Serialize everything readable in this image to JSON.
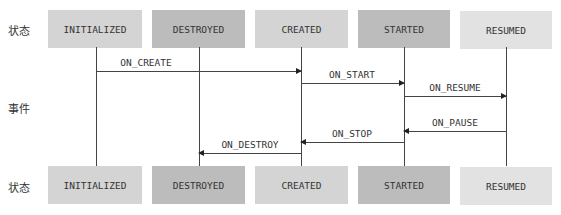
{
  "labels": {
    "top_state": "状态",
    "event": "事件",
    "bottom_state": "状态"
  },
  "states": [
    {
      "name": "INITIALIZED",
      "color": "#d4d4d4"
    },
    {
      "name": "DESTROYED",
      "color": "#bcbcbc"
    },
    {
      "name": "CREATED",
      "color": "#d4d4d4"
    },
    {
      "name": "STARTED",
      "color": "#bcbcbc"
    },
    {
      "name": "RESUMED",
      "color": "#e2e2e2"
    }
  ],
  "events": [
    {
      "name": "ON_CREATE",
      "from": 0,
      "to": 2
    },
    {
      "name": "ON_START",
      "from": 2,
      "to": 3
    },
    {
      "name": "ON_RESUME",
      "from": 3,
      "to": 4
    },
    {
      "name": "ON_PAUSE",
      "from": 4,
      "to": 3
    },
    {
      "name": "ON_STOP",
      "from": 3,
      "to": 2
    },
    {
      "name": "ON_DESTROY",
      "from": 2,
      "to": 1
    }
  ]
}
